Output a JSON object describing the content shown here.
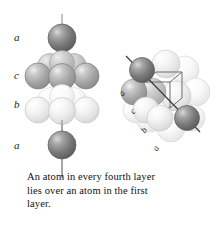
{
  "figure": {
    "caption": "An atom in every fourth layer lies over an atom in the first layer.",
    "background_color": "#ffffff"
  },
  "left_diagram": {
    "name": "layer-stack-diagram",
    "description": "Vertical stack of close-packed layers pierced by a vertical axis line",
    "axis_line_color": "#8a8a8a",
    "layer_labels": [
      {
        "text": "a",
        "x": 14,
        "y": 34,
        "layer": "top",
        "shade": "dark"
      },
      {
        "text": "c",
        "x": 14,
        "y": 72,
        "layer": "third",
        "shade": "medium"
      },
      {
        "text": "b",
        "x": 14,
        "y": 101,
        "layer": "second",
        "shade": "light"
      },
      {
        "text": "a",
        "x": 14,
        "y": 142,
        "layer": "bottom",
        "shade": "dark"
      }
    ],
    "layers": [
      {
        "id": "a-top",
        "shade": "dark",
        "color": "#7c7c7c",
        "atom_count": 1
      },
      {
        "id": "c",
        "shade": "medium",
        "color": "#a9a9a9",
        "atom_count": 7
      },
      {
        "id": "b",
        "shade": "light",
        "color": "#ececec",
        "atom_count": 7
      },
      {
        "id": "a-bottom",
        "shade": "dark",
        "color": "#7c7c7c",
        "atom_count": 1
      }
    ]
  },
  "right_diagram": {
    "name": "fcc-unit-cell-diagram",
    "description": "Close-packed spheres with a cubic unit cell outline and a body-diagonal line through two dark corner atoms",
    "cube_line_color": "#6e6e6e",
    "cube_dashed_line_color": "#9a9a9a",
    "diagonal_line_color": "#3a3a3a",
    "diagonal_labels": [
      {
        "text": "a",
        "x": 121,
        "y": 93
      },
      {
        "text": "c",
        "x": 132,
        "y": 111
      },
      {
        "text": "b",
        "x": 143,
        "y": 130
      },
      {
        "text": "a",
        "x": 155,
        "y": 148
      }
    ],
    "highlight_atoms": [
      {
        "id": "corner-top-left",
        "color": "#7c7c7c",
        "cx": 141,
        "cy": 69
      },
      {
        "id": "corner-bottom-right",
        "color": "#7c7c7c",
        "cx": 187,
        "cy": 117
      }
    ]
  },
  "palette": {
    "dark_sphere": "#7c7c7c",
    "dark_sphere_edge": "#4f4f4f",
    "medium_sphere": "#ababab",
    "medium_sphere_edge": "#757575",
    "light_sphere": "#efefef",
    "light_sphere_edge": "#c2c2c2",
    "text": "#111111"
  }
}
